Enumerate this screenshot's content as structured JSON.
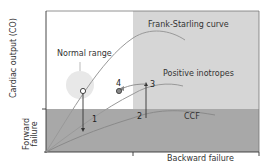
{
  "diagram": {
    "labels": {
      "frank_starling": "Frank-Starling curve",
      "normal_range": "Normal range",
      "positive_inotropes": "Positive inotropes",
      "ccf": "CCF",
      "y_axis": "Cardiac output (CO)",
      "forward_failure_line1": "Forward",
      "forward_failure_line2": "failure",
      "backward_failure": "Backward failure"
    },
    "markers": {
      "m1": "1",
      "m2": "2",
      "m3": "3",
      "m4": "4"
    },
    "colors": {
      "light_region": "#d9d9d9",
      "dark_region": "#a6a6a6",
      "normal_range_circle": "#e6e6e6",
      "axis": "#333333",
      "curve": "#9a9a9a"
    }
  }
}
